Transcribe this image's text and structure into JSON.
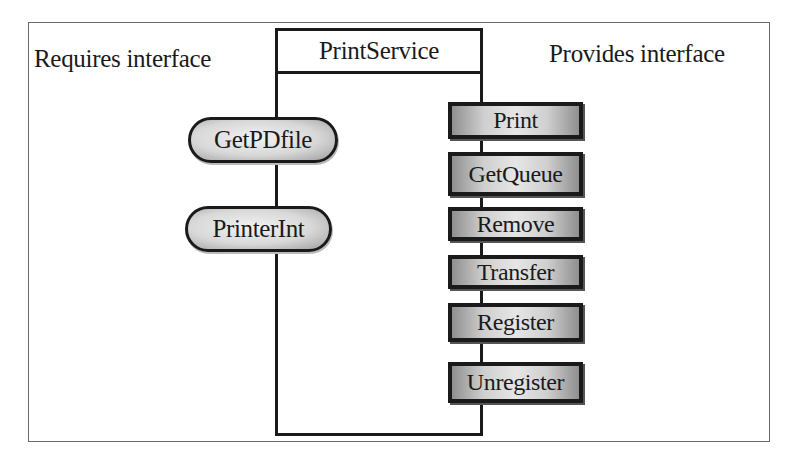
{
  "diagram": {
    "labels": {
      "requires": "Requires interface",
      "provides": "Provides interface"
    },
    "component": {
      "name": "PrintService"
    },
    "required_interfaces": [
      {
        "label": "GetPDfile",
        "shape": "rounded"
      },
      {
        "label": "PrinterInt",
        "shape": "rounded"
      }
    ],
    "provided_interfaces": [
      {
        "label": "Print",
        "shape": "rectangle"
      },
      {
        "label": "GetQueue",
        "shape": "rectangle"
      },
      {
        "label": "Remove",
        "shape": "rectangle"
      },
      {
        "label": "Transfer",
        "shape": "rectangle"
      },
      {
        "label": "Register",
        "shape": "rectangle"
      },
      {
        "label": "Unregister",
        "shape": "rectangle"
      }
    ],
    "colors": {
      "stroke": "#1a1a1a",
      "frame": "#6a6a6a",
      "fill_light": "#e6e6e6",
      "fill_dark": "#8f8f8f"
    }
  }
}
